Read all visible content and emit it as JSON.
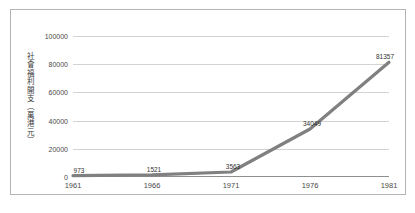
{
  "chart_data": {
    "type": "line",
    "title": "",
    "subtitle": "",
    "xlabel": "",
    "ylabel": "社會福利開支（萬港元）",
    "categories": [
      "1961",
      "1966",
      "1971",
      "1976",
      "1981"
    ],
    "x": [
      1961,
      1966,
      1971,
      1976,
      1981
    ],
    "values": [
      973,
      1521,
      3563,
      34049,
      81357
    ],
    "point_labels": [
      "973",
      "1521",
      "3563",
      "34049",
      "81357"
    ],
    "series": [
      {
        "name": "社會福利開支",
        "values": [
          973,
          1521,
          3563,
          34049,
          81357
        ],
        "color": "#808080"
      }
    ],
    "y_ticks": [
      0,
      20000,
      40000,
      60000,
      80000,
      100000
    ],
    "y_tick_labels": [
      "0",
      "20000",
      "40000",
      "60000",
      "80000",
      "100000"
    ],
    "ylim": [
      0,
      100000
    ],
    "xlim": [
      1961,
      1981
    ],
    "grid": true,
    "grid_axis": "y",
    "legend": false,
    "legend_position": "none",
    "colors": {
      "line": "#808080",
      "gridline": "#d3d3d3",
      "axis": "#8f8f8f",
      "frame_border": "#b4b4b4",
      "text": "#4a4a4a",
      "background": "#ffffff"
    }
  }
}
